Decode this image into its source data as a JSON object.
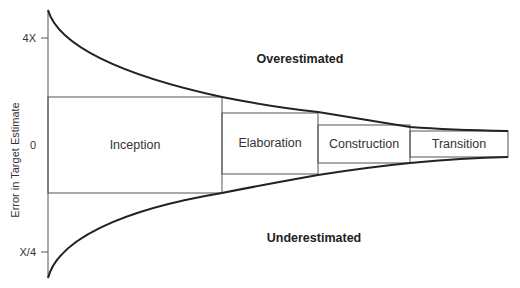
{
  "diagram": {
    "type": "cone-of-uncertainty",
    "y_axis": {
      "title": "Error in Target Estimate",
      "ticks": [
        "4X",
        "0",
        "X/4"
      ]
    },
    "regions": {
      "upper": "Overestimated",
      "lower": "Underestimated"
    },
    "phases": [
      {
        "label": "Inception"
      },
      {
        "label": "Elaboration"
      },
      {
        "label": "Construction"
      },
      {
        "label": "Transition"
      }
    ],
    "colors": {
      "line": "#222222",
      "box": "#555555",
      "text": "#333333",
      "background": "#ffffff"
    }
  }
}
